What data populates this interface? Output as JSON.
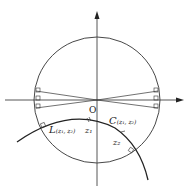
{
  "diagram": {
    "type": "geometric-figure",
    "origin_label": "O",
    "labels": {
      "L_main": "L",
      "L_args": "(z₁, z₂)",
      "C_main": "C",
      "C_args": "(z₁, z₂)",
      "z1": "z₁",
      "z2": "z₂"
    },
    "colors": {
      "stroke": "#333333",
      "axis": "#444444",
      "background": "#ffffff"
    }
  }
}
